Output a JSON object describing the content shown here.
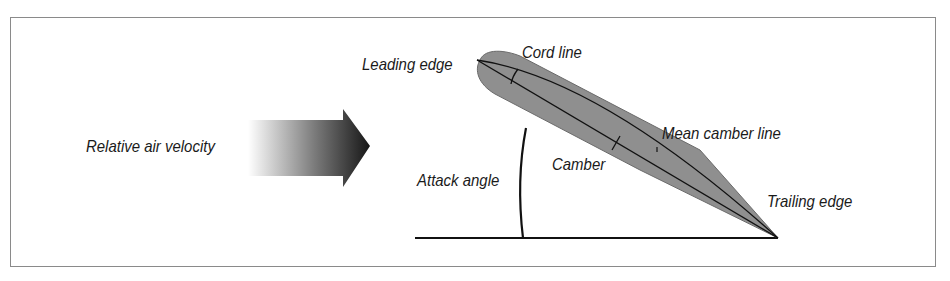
{
  "diagram": {
    "labels": {
      "relative_air_velocity": "Relative air velocity",
      "leading_edge": "Leading edge",
      "cord_line": "Cord line",
      "mean_camber_line": "Mean camber line",
      "camber": "Camber",
      "attack_angle": "Attack angle",
      "trailing_edge": "Trailing edge"
    },
    "colors": {
      "airfoil_fill": "#8f8f8f",
      "line": "#111111",
      "arrow_dark": "#1a1a1a",
      "arrow_light": "#ffffff",
      "frame_border": "#8a8a8a"
    }
  }
}
